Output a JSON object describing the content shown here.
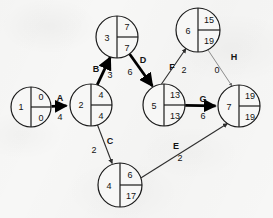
{
  "diagram": {
    "type": "aoa-network",
    "colors": {
      "ink": "#131313",
      "critical": "#000000",
      "normal": "#3a3a3a",
      "paper": "#f7f7f6"
    },
    "node_legend": {
      "left": "event number",
      "top_right": "earliest event time",
      "bottom_right": "latest event time"
    },
    "nodes": [
      {
        "id": "1",
        "number": "1",
        "earliest": "0",
        "latest": "0",
        "cx": 31,
        "cy": 107,
        "r": 20
      },
      {
        "id": "2",
        "number": "2",
        "earliest": "4",
        "latest": "4",
        "cx": 91,
        "cy": 105,
        "r": 21
      },
      {
        "id": "3",
        "number": "3",
        "earliest": "7",
        "latest": "7",
        "cx": 117,
        "cy": 37,
        "r": 21
      },
      {
        "id": "4",
        "number": "4",
        "earliest": "6",
        "latest": "17",
        "cx": 120,
        "cy": 185,
        "r": 22
      },
      {
        "id": "5",
        "number": "5",
        "earliest": "13",
        "latest": "13",
        "cx": 164,
        "cy": 105,
        "r": 21
      },
      {
        "id": "6",
        "number": "6",
        "earliest": "15",
        "latest": "19",
        "cx": 198,
        "cy": 30,
        "r": 22
      },
      {
        "id": "7",
        "number": "7",
        "earliest": "19",
        "latest": "19",
        "cx": 239,
        "cy": 106,
        "r": 21
      }
    ],
    "edges": [
      {
        "id": "A",
        "label": "A",
        "duration": "4",
        "from": "1",
        "to": "2",
        "critical": true,
        "label_x": 60,
        "label_y": 98,
        "dur_x": 60,
        "dur_y": 117
      },
      {
        "id": "B",
        "label": "B",
        "duration": "3",
        "from": "2",
        "to": "3",
        "critical": true,
        "label_x": 96,
        "label_y": 69,
        "dur_x": 110,
        "dur_y": 75
      },
      {
        "id": "C",
        "label": "C",
        "duration": "2",
        "from": "2",
        "to": "4",
        "critical": false,
        "label_x": 110,
        "label_y": 141,
        "dur_x": 94,
        "dur_y": 150
      },
      {
        "id": "D",
        "label": "D",
        "duration": "6",
        "from": "3",
        "to": "5",
        "critical": true,
        "label_x": 143,
        "label_y": 60,
        "dur_x": 130,
        "dur_y": 72
      },
      {
        "id": "E",
        "label": "E",
        "duration": "2",
        "from": "4",
        "to": "7",
        "critical": false,
        "label_x": 176,
        "label_y": 146,
        "dur_x": 180,
        "dur_y": 158
      },
      {
        "id": "F",
        "label": "F",
        "duration": "2",
        "from": "5",
        "to": "6",
        "critical": false,
        "label_x": 172,
        "label_y": 67,
        "dur_x": 184,
        "dur_y": 70
      },
      {
        "id": "G",
        "label": "G",
        "duration": "6",
        "from": "5",
        "to": "7",
        "critical": true,
        "label_x": 203,
        "label_y": 99,
        "dur_x": 203,
        "dur_y": 116
      },
      {
        "id": "H",
        "label": "H",
        "duration": "0",
        "from": "6",
        "to": "7",
        "critical": false,
        "label_x": 234,
        "label_y": 57,
        "dur_x": 217,
        "dur_y": 70
      }
    ],
    "critical_path": [
      "1",
      "2",
      "3",
      "5",
      "7"
    ]
  }
}
